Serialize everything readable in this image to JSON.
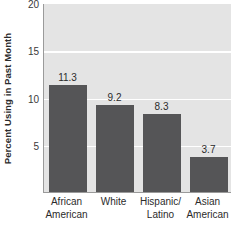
{
  "chart_data": {
    "type": "bar",
    "title": "",
    "subtitle": "",
    "xlabel": "",
    "ylabel": "Percent Using in Past Month",
    "categories": [
      "African American",
      "White",
      "Hispanic/ Latino",
      "Asian American"
    ],
    "category_lines": [
      [
        "African",
        "American"
      ],
      [
        "White",
        ""
      ],
      [
        "Hispanic/",
        "Latino"
      ],
      [
        "Asian",
        "American"
      ]
    ],
    "values": [
      11.3,
      9.2,
      8.3,
      3.7
    ],
    "value_labels": [
      "11.3",
      "9.2",
      "8.3",
      "3.7"
    ],
    "ylim": [
      0,
      20
    ],
    "yticks": [
      5,
      10,
      15,
      20
    ],
    "ytick_labels": [
      "5",
      "10",
      "15",
      "20"
    ],
    "grid": true,
    "gridlines_at": [
      5,
      10,
      15
    ],
    "legend": [],
    "legend_position": "none",
    "annotations": [],
    "colors": {
      "bar_fill": "#555557",
      "plot_background": "#e4e4e4",
      "gridline": "#ffffff",
      "axis_line": "#9a9a9a",
      "text": "#2b2b2b",
      "page_background": "#ffffff"
    }
  }
}
